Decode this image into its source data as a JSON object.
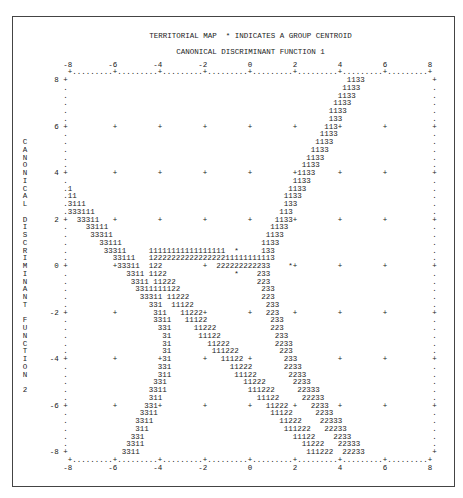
{
  "title": "TERRITORIAL MAP  * INDICATES A GROUP CENTROID",
  "x_axis_title": "CANONICAL DISCRIMINANT FUNCTION 1",
  "y_axis_title": "CANONICAL DISCRIMINANT FUNCTION 2",
  "y_axis_title_vertical": "C\nA\nN\nO\nN\nI\nC\nA\nL\n\nD\nI\nS\nC\nR\nI\nM\nI\nN\nA\nN\nT\n\nF\nU\nN\nC\nT\nI\nO\nN\n\n2",
  "chart_data": {
    "type": "scatter",
    "subtype": "territorial_map",
    "title": "TERRITORIAL MAP  * INDICATES A GROUP CENTROID",
    "xlabel": "CANONICAL DISCRIMINANT FUNCTION 1",
    "ylabel": "CANONICAL DISCRIMINANT FUNCTION 2",
    "xlim": [
      -8,
      8
    ],
    "ylim": [
      -8,
      8
    ],
    "x_ticks": [
      -8,
      -6,
      -4,
      -2,
      0,
      2,
      4,
      6,
      8
    ],
    "y_ticks": [
      8,
      6,
      4,
      2,
      0,
      -2,
      -4,
      -6,
      -8
    ],
    "tick_step": 2,
    "cols_per_unit": 5,
    "rows_per_unit": 3,
    "grid": "+ marks at every 2 units; dotted axis lines top and bottom",
    "legend": "* indicates a group centroid",
    "groups": [
      "1",
      "2",
      "3"
    ],
    "centroids": [
      {
        "group": "1",
        "x": -0.6,
        "y": 0.67
      },
      {
        "group": "2",
        "x": -0.6,
        "y": -0.33
      },
      {
        "group": "3",
        "x": 1.8,
        "y": 0.0
      }
    ],
    "territories": {
      "1": "upper-middle wedge between the 3/1 boundary (left) and the 1/3 boundary (right), bounded below by the 1/2 boundary near y=0.5",
      "2": "lower-middle wedge between the 1/2 boundary (left, descending to the lower right) and the 2/3 boundary (right)",
      "3": "left region and right region outside the boundaries"
    },
    "territory_rows": [
      [
        [
          62,
          "1133"
        ]
      ],
      [
        [
          61,
          "1133"
        ]
      ],
      [
        [
          60,
          "1133"
        ]
      ],
      [
        [
          59,
          "1133"
        ]
      ],
      [
        [
          58,
          "1133"
        ]
      ],
      [
        [
          58,
          "133"
        ]
      ],
      [
        [
          57,
          "113+"
        ]
      ],
      [
        [
          56,
          "1133"
        ]
      ],
      [
        [
          55,
          "1133"
        ]
      ],
      [
        [
          54,
          "1133"
        ]
      ],
      [
        [
          53,
          "1133"
        ]
      ],
      [
        [
          52,
          "1133"
        ]
      ],
      [
        [
          50,
          "+1133"
        ]
      ],
      [
        [
          50,
          "1133"
        ]
      ],
      [
        [
          0,
          "1"
        ],
        [
          49,
          "1133"
        ]
      ],
      [
        [
          0,
          "11"
        ],
        [
          48,
          "1133"
        ]
      ],
      [
        [
          0,
          "3111"
        ],
        [
          48,
          "133"
        ]
      ],
      [
        [
          0,
          "333111"
        ],
        [
          47,
          "113"
        ]
      ],
      [
        [
          2,
          "33311"
        ],
        [
          46,
          "1133+"
        ]
      ],
      [
        [
          4,
          "33111"
        ],
        [
          45,
          "1133"
        ]
      ],
      [
        [
          5,
          "33311"
        ],
        [
          44,
          "1133"
        ]
      ],
      [
        [
          7,
          "33111"
        ],
        [
          43,
          "1133"
        ]
      ],
      [
        [
          8,
          "33311"
        ],
        [
          18,
          "11111111111111111"
        ],
        [
          37,
          "*"
        ],
        [
          43,
          "133"
        ]
      ],
      [
        [
          10,
          "33111"
        ],
        [
          18,
          "1222222222222222211111111113"
        ]
      ],
      [
        [
          10,
          "+33311"
        ],
        [
          18,
          "122"
        ],
        [
          33,
          "222222222233"
        ],
        [
          49,
          "*+"
        ]
      ],
      [
        [
          13,
          "3311"
        ],
        [
          18,
          "1122"
        ],
        [
          37,
          "*"
        ],
        [
          42,
          "233"
        ]
      ],
      [
        [
          14,
          "3311"
        ],
        [
          19,
          "11222"
        ],
        [
          42,
          "223"
        ]
      ],
      [
        [
          15,
          "3311111122"
        ],
        [
          43,
          "233"
        ]
      ],
      [
        [
          16,
          "33311"
        ],
        [
          22,
          "11222"
        ],
        [
          43,
          "223"
        ]
      ],
      [
        [
          18,
          "331"
        ],
        [
          23,
          "11122"
        ],
        [
          44,
          "233"
        ]
      ],
      [
        [
          19,
          "311"
        ],
        [
          25,
          "11222+"
        ],
        [
          44,
          "223"
        ]
      ],
      [
        [
          19,
          "3311"
        ],
        [
          26,
          "11122"
        ],
        [
          45,
          "233"
        ]
      ],
      [
        [
          20,
          "331"
        ],
        [
          28,
          "11222"
        ],
        [
          45,
          "223"
        ]
      ],
      [
        [
          21,
          "31"
        ],
        [
          29,
          "11122"
        ],
        [
          46,
          "233"
        ]
      ],
      [
        [
          21,
          "31"
        ],
        [
          31,
          "11222"
        ],
        [
          46,
          "2233"
        ]
      ],
      [
        [
          21,
          "31"
        ],
        [
          32,
          "111222"
        ],
        [
          47,
          "223"
        ]
      ],
      [
        [
          20,
          "+31"
        ],
        [
          34,
          "11122"
        ],
        [
          48,
          "233"
        ]
      ],
      [
        [
          20,
          "331"
        ],
        [
          36,
          "11222"
        ],
        [
          48,
          "2233"
        ]
      ],
      [
        [
          20,
          "311"
        ],
        [
          37,
          "11122"
        ],
        [
          49,
          "2233"
        ]
      ],
      [
        [
          19,
          "331"
        ],
        [
          39,
          "11222"
        ],
        [
          50,
          "2233"
        ]
      ],
      [
        [
          18,
          "3311"
        ],
        [
          40,
          "111222"
        ],
        [
          51,
          "22333"
        ]
      ],
      [
        [
          18,
          "311"
        ],
        [
          42,
          "11122"
        ],
        [
          52,
          "22233"
        ]
      ],
      [
        [
          17,
          "331+"
        ],
        [
          44,
          "11222"
        ],
        [
          54,
          "2233"
        ]
      ],
      [
        [
          16,
          "3311"
        ],
        [
          45,
          "11122"
        ],
        [
          55,
          "2233"
        ]
      ],
      [
        [
          15,
          "3311"
        ],
        [
          47,
          "11222"
        ],
        [
          56,
          "22333"
        ]
      ],
      [
        [
          15,
          "311"
        ],
        [
          48,
          "111222"
        ],
        [
          57,
          "22233"
        ]
      ],
      [
        [
          14,
          "331"
        ],
        [
          50,
          "11122"
        ],
        [
          59,
          "2233"
        ]
      ],
      [
        [
          13,
          "3311"
        ],
        [
          52,
          "11222"
        ],
        [
          60,
          "22333"
        ]
      ],
      [
        [
          12,
          "3311"
        ],
        [
          53,
          "111222"
        ],
        [
          61,
          "22233"
        ]
      ]
    ]
  }
}
